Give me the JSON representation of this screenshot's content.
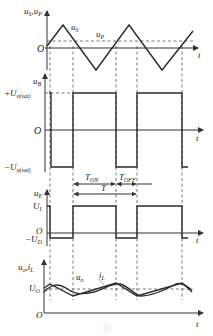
{
  "figure": {
    "plot1": {
      "y_label": "u",
      "y_label_sub": "S",
      "y_label2": "u",
      "y_label2_sub": "P",
      "origin": "O",
      "t_label": "t",
      "curve_us_label": "u",
      "curve_us_sub": "S",
      "curve_up_label": "u",
      "curve_up_sub": "P"
    },
    "plot2": {
      "y_label": "u",
      "y_label_sub": "B",
      "pos_level": "+U",
      "pos_level_sub": "o(sat)",
      "neg_level": "−U",
      "neg_level_sub": "o(sat)",
      "origin": "O",
      "t_label": "t",
      "t_on": "T",
      "t_on_sub": "ON",
      "t_off": "T",
      "t_off_sub": "OFF",
      "period": "T"
    },
    "plot3": {
      "y_label": "u",
      "y_label_sub": "E",
      "high_level": "U",
      "high_level_sub": "I",
      "low_level": "−U",
      "low_level_sub": "D",
      "origin": "O",
      "t_label": "t"
    },
    "plot4": {
      "y_label": "u",
      "y_label_sub": "o",
      "y_label2": "i",
      "y_label2_sub": "L",
      "avg_level": "U",
      "avg_level_sub": "O",
      "origin": "O",
      "t_label": "t",
      "curve_uo_label": "u",
      "curve_uo_sub": "o",
      "curve_il_label": "i",
      "curve_il_sub": "L"
    },
    "caption": "图"
  }
}
